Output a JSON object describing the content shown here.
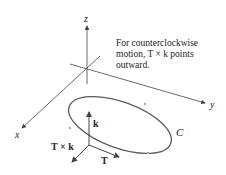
{
  "axes": {
    "x_label": "x",
    "y_label": "y",
    "z_label": "z"
  },
  "curve_label": "C",
  "vectors": {
    "k_label": "k",
    "T_label": "T",
    "TxK_label": "T × k"
  },
  "annotation": {
    "line1": "For counterclockwise",
    "line2": "motion, T × k points",
    "line3": "outward."
  },
  "colors": {
    "curve": "#5a5a6a",
    "axes": "#444444",
    "arrow_marks": "#aaaaaa"
  }
}
